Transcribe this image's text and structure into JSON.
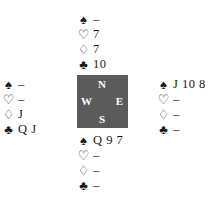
{
  "suit_symbols": {
    "spades": "♠",
    "hearts": "♡",
    "diamonds": "♢",
    "clubs": "♣"
  },
  "compass": {
    "north": "N",
    "west": "W",
    "east": "E",
    "south": "S",
    "background_color": "#5b5b5b"
  },
  "hands": {
    "north": {
      "spades": "–",
      "hearts": "7",
      "diamonds": "7",
      "clubs": "10"
    },
    "west": {
      "spades": "–",
      "hearts": "–",
      "diamonds": "J",
      "clubs": "Q J"
    },
    "east": {
      "spades": "J 10 8",
      "hearts": "–",
      "diamonds": "–",
      "clubs": "–"
    },
    "south": {
      "spades": "Q 9 7",
      "hearts": "–",
      "diamonds": "–",
      "clubs": "–"
    }
  }
}
